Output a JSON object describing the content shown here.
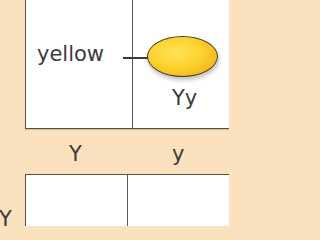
{
  "diagram": {
    "type": "punnett-square",
    "top_alleles": [
      "Y",
      "y"
    ],
    "side_alleles": [
      "Y"
    ],
    "highlighted_cell": {
      "phenotype": "yellow",
      "genotype": "Yy",
      "seed_color": "#fcd22e"
    }
  },
  "colors": {
    "background": "#fbdfba",
    "cell": "#ffffff",
    "border": "#5a5048",
    "seed_fill": "#fcd22e",
    "text": "#3c3c3c"
  }
}
